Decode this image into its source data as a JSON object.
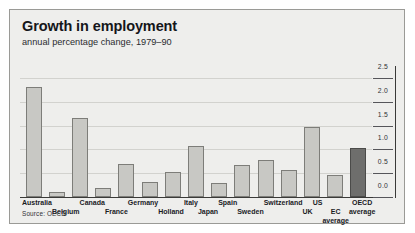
{
  "chart_data": {
    "type": "bar",
    "title": "Growth in employment",
    "subtitle": "annual percentage change, 1979–90",
    "xlabel": "",
    "ylabel": "",
    "ylim": [
      0.0,
      2.75
    ],
    "yticks": [
      "0.0",
      "0.5",
      "1.0",
      "1.5",
      "2.0",
      "2.5"
    ],
    "ytick_values": [
      0.0,
      0.5,
      1.0,
      1.5,
      2.0,
      2.5
    ],
    "grid": true,
    "legend": "none",
    "axis_position": "right",
    "source": "Source: OECD",
    "categories": [
      "Australia",
      "Belgium",
      "Canada",
      "France",
      "Germany",
      "Holland",
      "Italy",
      "Japan",
      "Spain",
      "Sweden",
      "Switzerland",
      "UK",
      "US",
      "EC average",
      "OECD average"
    ],
    "values": [
      2.3,
      0.1,
      1.65,
      0.18,
      0.7,
      0.32,
      0.52,
      1.07,
      0.3,
      0.68,
      0.78,
      0.57,
      1.47,
      0.47,
      1.02
    ],
    "highlight_index": 14,
    "highlight_color": "#6e6e6c",
    "bar_color": "#c8c8c4",
    "bar_border_color": "#7d7d79"
  },
  "labels": {
    "rows": [
      {
        "row": "top",
        "text": "Australia"
      },
      {
        "row": "bottom",
        "text": "Belgium"
      },
      {
        "row": "top",
        "text": "Canada"
      },
      {
        "row": "bottom",
        "text": "France"
      },
      {
        "row": "top",
        "text": "Germany"
      },
      {
        "row": "bottom",
        "text": "Holland"
      },
      {
        "row": "top",
        "text": "Italy"
      },
      {
        "row": "bottom",
        "text": "Japan"
      },
      {
        "row": "top",
        "text": "Spain"
      },
      {
        "row": "bottom",
        "text": "Sweden"
      },
      {
        "row": "top",
        "text": "Switzerland"
      },
      {
        "row": "bottom",
        "text": "UK"
      },
      {
        "row": "top",
        "text": "US"
      },
      {
        "row": "bottom",
        "text": "EC",
        "text2": "average"
      },
      {
        "row": "top",
        "text": "OECD",
        "text2": "average"
      }
    ]
  }
}
